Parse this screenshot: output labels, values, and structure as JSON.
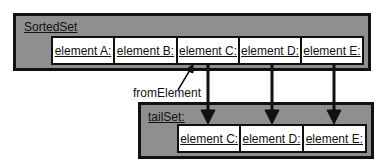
{
  "sorted_set": {
    "label": "SortedSet",
    "elements": [
      "element A:",
      "element B:",
      "element C:",
      "element D:",
      "element E:"
    ]
  },
  "tail_set": {
    "label": "tailSet:",
    "elements": [
      "element C:",
      "element D:",
      "element E:"
    ]
  },
  "annotation": {
    "label": "fromElement"
  },
  "colors": {
    "box_fill": "#8f8f8f",
    "border": "#111111",
    "cell_fill": "#ffffff"
  }
}
